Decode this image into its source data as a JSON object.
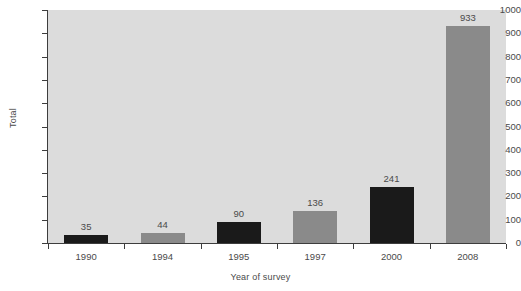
{
  "chart_data": {
    "type": "bar",
    "title": "",
    "xlabel": "Year of survey",
    "ylabel": "Total",
    "categories": [
      "1990",
      "1994",
      "1995",
      "1997",
      "2000",
      "2008"
    ],
    "values": [
      35,
      44,
      90,
      136,
      241,
      933
    ],
    "value_labels": [
      "35",
      "44",
      "90",
      "136",
      "241",
      "933"
    ],
    "bar_colors": [
      "#1a1a1a",
      "#8a8a8a",
      "#1a1a1a",
      "#8a8a8a",
      "#1a1a1a",
      "#8a8a8a"
    ],
    "ylim": [
      0,
      1000
    ],
    "ytick_values": [
      0,
      100,
      200,
      300,
      400,
      500,
      600,
      700,
      800,
      900,
      1000
    ],
    "ytick_labels": [
      "0",
      "100",
      "200",
      "300",
      "400",
      "500",
      "600",
      "700",
      "800",
      "900",
      "1000"
    ],
    "grid": false,
    "legend": "none",
    "plot_background": "#dcdcdc",
    "page_background": "#ffffff",
    "axis_color": "#3d3d3d",
    "text_color": "#4a4a4a"
  }
}
